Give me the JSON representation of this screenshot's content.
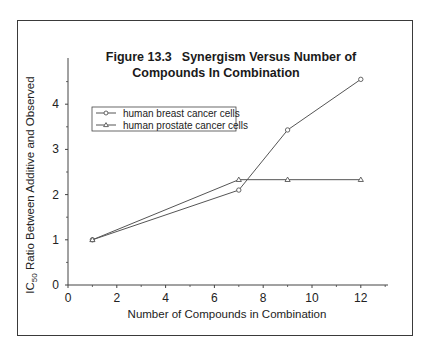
{
  "figure": {
    "title_line1_number": "Figure 13.3",
    "title_line1_text": "Synergism Versus Number of",
    "title_line2": "Compounds In Combination"
  },
  "axes": {
    "x_label": "Number of Compounds in Combination",
    "y_label_prefix": "IC",
    "y_label_sub": "50",
    "y_label_suffix": " Ratio Between Additive and Observed",
    "x_ticks": [
      "0",
      "2",
      "4",
      "6",
      "8",
      "10",
      "12"
    ],
    "y_ticks": [
      "0",
      "1",
      "2",
      "3",
      "4"
    ]
  },
  "legend": {
    "items": [
      {
        "label": "human breast cancer cells",
        "marker": "circle"
      },
      {
        "label": "human prostate cancer cells",
        "marker": "triangle"
      }
    ]
  },
  "colors": {
    "line": "#555555",
    "frame": "#3a3a3a",
    "text": "#222222"
  },
  "chart_data": {
    "type": "line",
    "xlabel": "Number of Compounds in Combination",
    "ylabel": "IC50 Ratio Between Additive and Observed",
    "x": [
      1,
      7,
      9,
      12
    ],
    "series": [
      {
        "name": "human breast cancer cells",
        "marker": "circle",
        "values": [
          1.0,
          2.1,
          3.43,
          4.55
        ]
      },
      {
        "name": "human prostate cancer cells",
        "marker": "triangle",
        "values": [
          1.0,
          2.33,
          2.33,
          2.33
        ]
      }
    ],
    "xlim": [
      0,
      13.2
    ],
    "ylim": [
      0,
      5
    ],
    "x_ticks": [
      0,
      2,
      4,
      6,
      8,
      10,
      12
    ],
    "y_ticks": [
      0,
      1,
      2,
      3,
      4
    ],
    "grid": false,
    "legend_position": "upper left (inside plot)"
  }
}
